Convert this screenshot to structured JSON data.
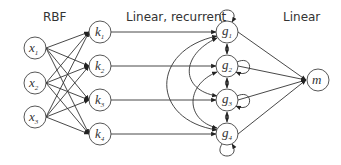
{
  "headings": {
    "rbf": "RBF",
    "recurrent": "Linear, recurrent",
    "linear": "Linear"
  },
  "layers": {
    "input": [
      {
        "id": "x1",
        "base": "x",
        "sub": "1"
      },
      {
        "id": "x2",
        "base": "x",
        "sub": "2"
      },
      {
        "id": "x3",
        "base": "x",
        "sub": "3"
      }
    ],
    "rbf": [
      {
        "id": "k1",
        "base": "k",
        "sub": "1"
      },
      {
        "id": "k2",
        "base": "k",
        "sub": "2"
      },
      {
        "id": "k3",
        "base": "k",
        "sub": "3"
      },
      {
        "id": "k4",
        "base": "k",
        "sub": "4"
      }
    ],
    "recurrent": [
      {
        "id": "g1",
        "base": "g",
        "sub": "1"
      },
      {
        "id": "g2",
        "base": "g",
        "sub": "2"
      },
      {
        "id": "g3",
        "base": "g",
        "sub": "3"
      },
      {
        "id": "g4",
        "base": "g",
        "sub": "4"
      }
    ],
    "output": [
      {
        "id": "m",
        "base": "m",
        "sub": ""
      }
    ]
  },
  "connections": {
    "input_to_rbf": "fully connected",
    "rbf_to_recurrent": "one-to-one",
    "recurrent": "self-loops, adjacent bidirectional, long-range arcs",
    "recurrent_to_output": "all to m"
  }
}
